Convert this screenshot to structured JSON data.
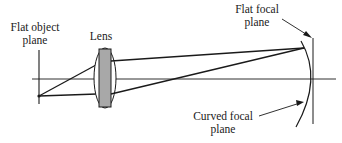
{
  "diagram": {
    "labels": {
      "object_plane_line1": "Flat object",
      "object_plane_line2": "plane",
      "lens": "Lens",
      "flat_focal_line1": "Flat focal",
      "flat_focal_line2": "plane",
      "curved_focal_line1": "Curved focal",
      "curved_focal_line2": "plane"
    },
    "colors": {
      "line": "#1a1a1a",
      "lens_fill": "#a8a8a8",
      "background": "#ffffff"
    }
  }
}
